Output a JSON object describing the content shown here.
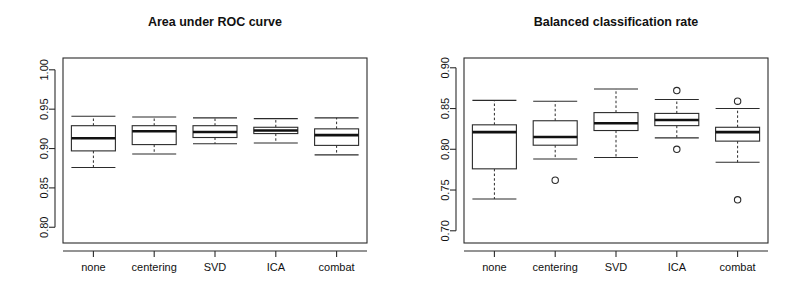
{
  "figure": {
    "width": 802,
    "height": 295,
    "background": "#ffffff",
    "ink_color": "#2b2b2b"
  },
  "panels": [
    {
      "id": "left",
      "title": "Area under ROC curve"
    },
    {
      "id": "right",
      "title": "Balanced classification rate"
    }
  ],
  "chart_data": [
    {
      "type": "box",
      "title": "Area under ROC curve",
      "xlabel": "",
      "ylabel": "",
      "ylim": [
        0.78,
        1.015
      ],
      "yticks": [
        0.8,
        0.85,
        0.9,
        0.95,
        1.0
      ],
      "ytick_labels": [
        "0.80",
        "0.85",
        "0.90",
        "0.95",
        "1.00"
      ],
      "grid": false,
      "legend": "none",
      "categories": [
        "none",
        "centering",
        "SVD",
        "ICA",
        "combat"
      ],
      "boxes": [
        {
          "category": "none",
          "whisker_low": 0.876,
          "q1": 0.897,
          "median": 0.913,
          "q3": 0.929,
          "whisker_high": 0.941,
          "outliers": []
        },
        {
          "category": "centering",
          "whisker_low": 0.893,
          "q1": 0.905,
          "median": 0.922,
          "q3": 0.929,
          "whisker_high": 0.94,
          "outliers": []
        },
        {
          "category": "SVD",
          "whisker_low": 0.906,
          "q1": 0.914,
          "median": 0.921,
          "q3": 0.929,
          "whisker_high": 0.939,
          "outliers": []
        },
        {
          "category": "ICA",
          "whisker_low": 0.907,
          "q1": 0.919,
          "median": 0.923,
          "q3": 0.927,
          "whisker_high": 0.938,
          "outliers": []
        },
        {
          "category": "combat",
          "whisker_low": 0.892,
          "q1": 0.904,
          "median": 0.917,
          "q3": 0.925,
          "whisker_high": 0.939,
          "outliers": []
        }
      ]
    },
    {
      "type": "box",
      "title": "Balanced classification rate",
      "xlabel": "",
      "ylabel": "",
      "ylim": [
        0.685,
        0.912
      ],
      "yticks": [
        0.7,
        0.75,
        0.8,
        0.85,
        0.9
      ],
      "ytick_labels": [
        "0.70",
        "0.75",
        "0.80",
        "0.85",
        "0.90"
      ],
      "grid": false,
      "legend": "none",
      "categories": [
        "none",
        "centering",
        "SVD",
        "ICA",
        "combat"
      ],
      "boxes": [
        {
          "category": "none",
          "whisker_low": 0.739,
          "q1": 0.776,
          "median": 0.821,
          "q3": 0.83,
          "whisker_high": 0.86,
          "outliers": []
        },
        {
          "category": "centering",
          "whisker_low": 0.788,
          "q1": 0.805,
          "median": 0.815,
          "q3": 0.835,
          "whisker_high": 0.859,
          "outliers": [
            0.762
          ]
        },
        {
          "category": "SVD",
          "whisker_low": 0.79,
          "q1": 0.823,
          "median": 0.832,
          "q3": 0.845,
          "whisker_high": 0.874,
          "outliers": []
        },
        {
          "category": "ICA",
          "whisker_low": 0.814,
          "q1": 0.829,
          "median": 0.836,
          "q3": 0.844,
          "whisker_high": 0.861,
          "outliers": [
            0.872,
            0.8
          ]
        },
        {
          "category": "combat",
          "whisker_low": 0.784,
          "q1": 0.81,
          "median": 0.821,
          "q3": 0.827,
          "whisker_high": 0.85,
          "outliers": [
            0.859,
            0.738
          ]
        }
      ]
    }
  ]
}
